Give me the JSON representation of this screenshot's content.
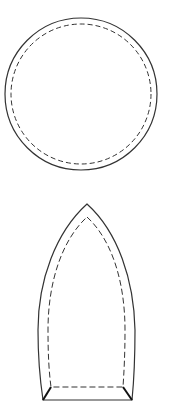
{
  "diagram": {
    "shapes": [
      {
        "name": "circle-pattern",
        "outline": "solid",
        "seam_line": "dashed"
      },
      {
        "name": "pointed-arch-pattern",
        "outline": "solid",
        "seam_line": "dashed"
      }
    ],
    "colors": {
      "stroke": "#333333",
      "background": "#ffffff"
    }
  }
}
